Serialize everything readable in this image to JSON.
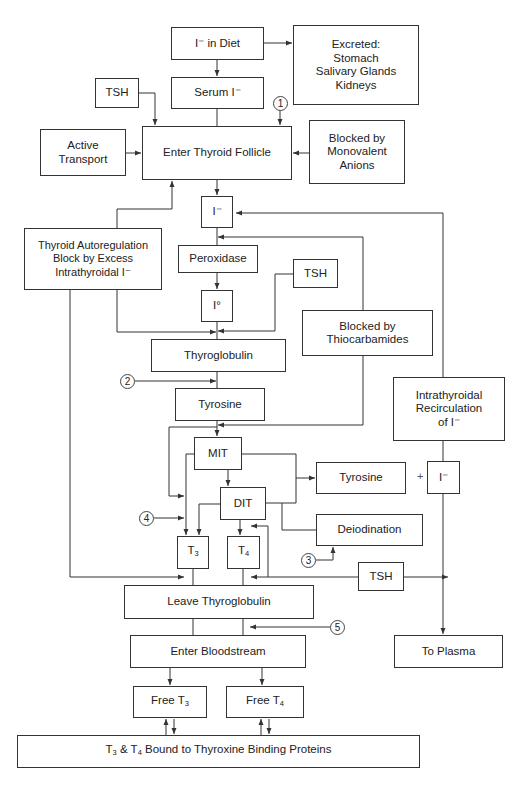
{
  "nodes": {
    "diet": "I⁻ in Diet",
    "excreted": "Excreted:\nStomach\nSalivary Glands\nKidneys",
    "tsh_top": "TSH",
    "serum": "Serum I⁻",
    "active_transport": "Active\nTransport",
    "enter_follicle": "Enter Thyroid Follicle",
    "blocked_monovalent": "Blocked by\nMonovalent\nAnions",
    "iodide": "I⁻",
    "autoregulation": "Thyroid Autoregulation\nBlock by Excess\nIntrathyroidal I⁻",
    "peroxidase": "Peroxidase",
    "tsh_mid": "TSH",
    "iodine": "I°",
    "blocked_thiocarbamides": "Blocked by\nThiocarbamides",
    "thyroglobulin": "Thyroglobulin",
    "tyrosine": "Tyrosine",
    "recirculation": "Intrathyroidal\nRecirculation\nof I⁻",
    "mit": "MIT",
    "dit": "DIT",
    "tyrosine_right": "Tyrosine",
    "plus": "+",
    "iodide_right": "I⁻",
    "deiodination": "Deiodination",
    "t3_base": "T",
    "t3_sub": "3",
    "t4_base": "T",
    "t4_sub": "4",
    "tsh_bottom": "TSH",
    "leave_thyroglobulin": "Leave Thyroglobulin",
    "to_plasma": "To Plasma",
    "enter_bloodstream": "Enter Bloodstream",
    "free_t3_prefix": "Free T",
    "free_t3_sub": "3",
    "free_t4_prefix": "Free T",
    "free_t4_sub": "4",
    "bound_t3": "T",
    "bound_t3_sub": "3",
    "bound_amp": " & T",
    "bound_t4_sub": "4",
    "bound_rest": " Bound to Thyroxine Binding Proteins"
  },
  "markers": [
    "1",
    "2",
    "3",
    "4",
    "5"
  ],
  "colors": {
    "line": "#333333",
    "background": "#ffffff"
  }
}
